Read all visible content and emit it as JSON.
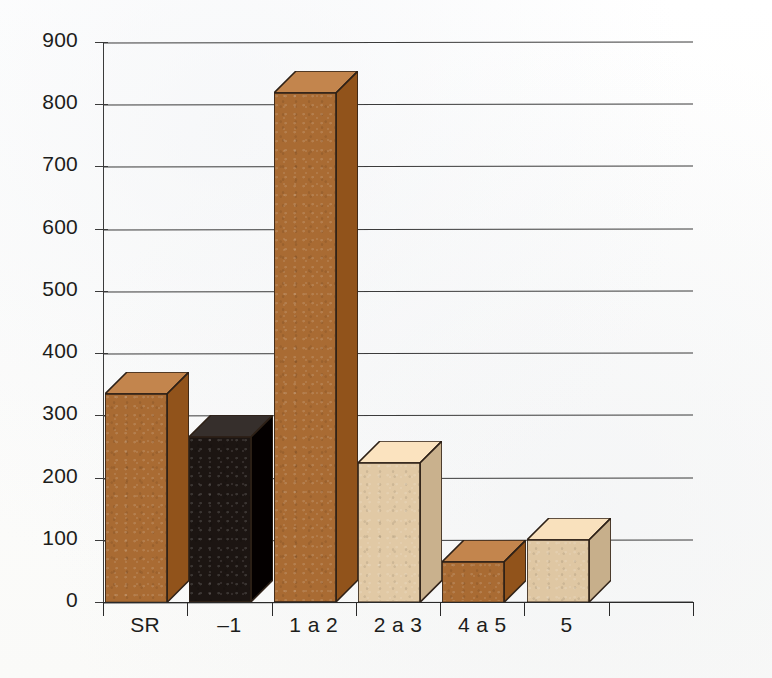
{
  "chart_data": {
    "type": "bar",
    "title": "",
    "subtitle": "",
    "xlabel": "",
    "ylabel": "",
    "categories": [
      "SR",
      "–1",
      "1 a 2",
      "2 a 3",
      "4 a 5",
      "5"
    ],
    "values": [
      335,
      265,
      818,
      224,
      65,
      100
    ],
    "series": [
      {
        "name": "",
        "values": [
          335,
          265,
          818,
          224,
          65,
          100
        ]
      }
    ],
    "bar_colors": [
      "#A96B33",
      "#1C1512",
      "#A96B33",
      "#E1C9A5",
      "#A96B33",
      "#DFC7A3"
    ],
    "ylim": [
      0,
      900
    ],
    "yticks": [
      0,
      100,
      200,
      300,
      400,
      500,
      600,
      700,
      800,
      900
    ],
    "ytick_labels": [
      "0",
      "100",
      "200",
      "300",
      "400",
      "500",
      "600",
      "700",
      "800",
      "900"
    ],
    "grid": true,
    "grid_axis": "y",
    "legend": false,
    "legend_position": "none",
    "style": "3d-bars",
    "annotations": []
  },
  "colors": {
    "brown": "#A96B33",
    "brown_top": "#C18A50",
    "brown_side": "#8E5527",
    "black": "#1C1512",
    "black_top": "#3A322E",
    "black_side": "#2A2421",
    "tan": "#E1C9A5",
    "tan_top": "#EEDCC0",
    "tan_side": "#C9AE88",
    "outline": "#2E2117",
    "grid": "#3B3B3B",
    "text": "#1D1D1B",
    "background": "#FDFDFC"
  }
}
